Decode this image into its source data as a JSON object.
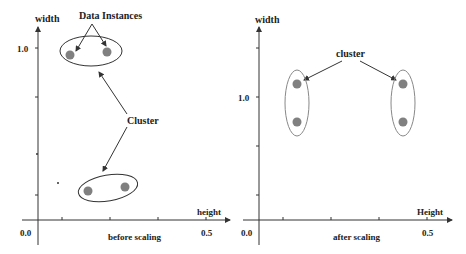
{
  "left_panel": {
    "y_axis_label": "width",
    "x_axis_label": "height",
    "y_tick_label": "1.0",
    "x_origin_label": "0.0",
    "x_end_label": "0.5",
    "caption": "before scaling",
    "annotation_points": "Data Instances",
    "annotation_cluster": "Cluster"
  },
  "right_panel": {
    "y_axis_label": "width",
    "x_axis_label": "Height",
    "y_tick_label": "1.0",
    "x_origin_label": "0.0",
    "x_end_label": "0.5",
    "caption": "after scaling",
    "annotation_cluster": "cluster"
  },
  "colors": {
    "axis": "#333333",
    "point": "#808080",
    "ellipse": "#333333",
    "ellipse_right": "#888888"
  }
}
